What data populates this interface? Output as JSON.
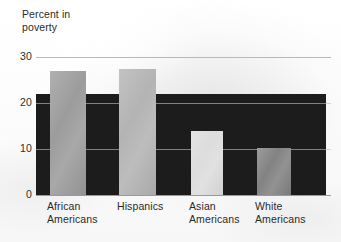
{
  "chart_data": {
    "type": "bar",
    "title": "Percent in poverty",
    "title_line1": "Percent in",
    "title_line2": "poverty",
    "xlabel": "",
    "ylabel": "Percent in poverty",
    "categories": [
      "African Americans",
      "Hispanics",
      "Asian Americans",
      "White Americans"
    ],
    "category_lines": [
      [
        "African",
        "Americans"
      ],
      [
        "Hispanics"
      ],
      [
        "Asian",
        "Americans"
      ],
      [
        "White",
        "Americans"
      ]
    ],
    "values": [
      27,
      27.5,
      14,
      10.2
    ],
    "ylim": [
      0,
      30
    ],
    "yticks": [
      0,
      10,
      20,
      30
    ],
    "ytick_labels": [
      "0",
      "10",
      "20",
      "30"
    ],
    "grid": true,
    "legend": "none",
    "bar_colors": [
      "#9a9a9a",
      "#b2b2b2",
      "#dcdcdc",
      "#808080"
    ],
    "background_band_color": "#1c1c1c",
    "background_band_top_value": 22,
    "gridline_color": "#b9b9b9",
    "text_color": "#2b2b2b"
  },
  "geometry": {
    "plot_left": 36,
    "plot_right": 331,
    "dark_band_right": 326,
    "y_zero": 195,
    "y_top": 57,
    "px_per_unit": 4.6,
    "bars": [
      {
        "x": 50,
        "width": 36
      },
      {
        "x": 119,
        "width": 37
      },
      {
        "x": 191,
        "width": 32
      },
      {
        "x": 257,
        "width": 34
      }
    ],
    "category_label_x": [
      47,
      117,
      189,
      255
    ],
    "category_label_y": 200,
    "tick_label_x": 12,
    "tick_label_width": 20
  }
}
